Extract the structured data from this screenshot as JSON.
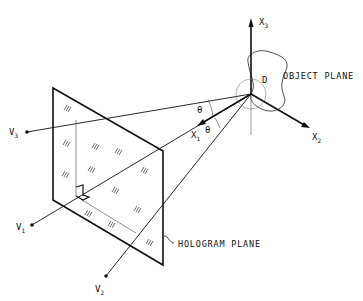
{
  "diagram": {
    "labels": {
      "object_plane": "OBJECT PLANE",
      "hologram_plane": "HOLOGRAM PLANE",
      "object_domain": "D",
      "axis_x1": "X",
      "axis_x1_sub": "1",
      "axis_x2": "X",
      "axis_x2_sub": "2",
      "axis_x3": "X",
      "axis_x3_sub": "3",
      "theta_upper": "θ",
      "theta_lower": "θ",
      "viewpoint_v1": "V",
      "viewpoint_v1_sub": "1",
      "viewpoint_v2": "V",
      "viewpoint_v2_sub": "2",
      "viewpoint_v3": "V",
      "viewpoint_v3_sub": "3"
    },
    "colors": {
      "ink": "#111111",
      "background": "#ffffff"
    }
  }
}
